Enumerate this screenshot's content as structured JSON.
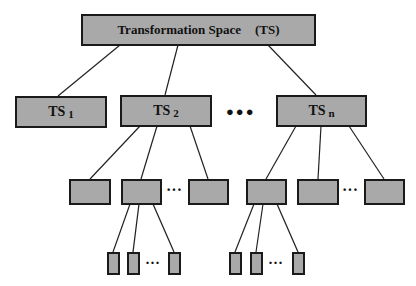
{
  "diagram": {
    "type": "tree",
    "root": {
      "label": "Transformation Space",
      "abbr": "(TS)"
    },
    "level1": [
      {
        "label": "TS",
        "sub": "1"
      },
      {
        "label": "TS",
        "sub": "2"
      },
      {
        "label": "TS",
        "sub": "n"
      }
    ],
    "level1_ellipsis": "●●●",
    "level2_ellipsis": "···",
    "level3_ellipsis": "···",
    "colors": {
      "box_fill": "#a9a9a9",
      "box_border": "#1a1a1a",
      "line": "#222222"
    }
  }
}
